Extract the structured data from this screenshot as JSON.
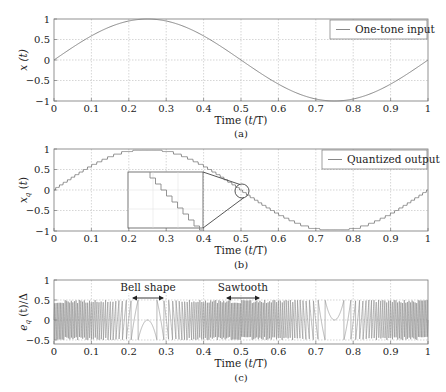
{
  "chart_data": [
    {
      "id": "a",
      "type": "line",
      "caption": "(a)",
      "xlabel": "Time (t/T)",
      "ylabel": "x (t)",
      "xlim": [
        0,
        1
      ],
      "ylim": [
        -1,
        1
      ],
      "xticks": [
        "0",
        "0.1",
        "0.2",
        "0.3",
        "0.4",
        "0.5",
        "0.6",
        "0.7",
        "0.8",
        "0.9",
        "1"
      ],
      "yticks": [
        "1",
        "0.5",
        "0",
        "-0.5",
        "-1"
      ],
      "grid": true,
      "legend": {
        "position": "upper right",
        "entries": [
          "One-tone input"
        ]
      },
      "series": [
        {
          "name": "One-tone input",
          "function": "sin(2*pi*t)",
          "x": [
            0,
            0.1,
            0.2,
            0.25,
            0.3,
            0.4,
            0.5,
            0.6,
            0.7,
            0.75,
            0.8,
            0.9,
            1
          ],
          "values": [
            0,
            0.59,
            0.95,
            1,
            0.95,
            0.59,
            0,
            -0.59,
            -0.95,
            -1,
            -0.95,
            -0.59,
            0
          ]
        }
      ]
    },
    {
      "id": "b",
      "type": "line",
      "caption": "(b)",
      "xlabel": "Time (t/T)",
      "ylabel": "x_q (t)",
      "xlim": [
        0,
        1
      ],
      "ylim": [
        -1,
        1
      ],
      "xticks": [
        "0",
        "0.1",
        "0.2",
        "0.3",
        "0.4",
        "0.5",
        "0.6",
        "0.7",
        "0.8",
        "0.9",
        "1"
      ],
      "yticks": [
        "1",
        "0.5",
        "0",
        "-0.5",
        "-1"
      ],
      "grid": true,
      "legend": {
        "position": "upper right",
        "entries": [
          "Quantized output"
        ]
      },
      "annotations": [
        "Inset zoom of staircase around t=0.5"
      ],
      "series": [
        {
          "name": "Quantized output",
          "function": "quantized sin(2*pi*t)",
          "x": [
            0,
            0.1,
            0.2,
            0.25,
            0.3,
            0.4,
            0.5,
            0.6,
            0.7,
            0.75,
            0.8,
            0.9,
            1
          ],
          "values": [
            0,
            0.59,
            0.95,
            0.97,
            0.95,
            0.59,
            0,
            -0.59,
            -0.95,
            -0.97,
            -0.95,
            -0.59,
            0
          ]
        }
      ]
    },
    {
      "id": "c",
      "type": "line",
      "caption": "(c)",
      "xlabel": "Time (t/T)",
      "ylabel": "e_q (t)/Δ",
      "xlim": [
        0,
        1
      ],
      "ylim": [
        -0.6,
        1
      ],
      "xticks": [
        "0",
        "0.1",
        "0.2",
        "0.3",
        "0.4",
        "0.5",
        "0.6",
        "0.7",
        "0.8",
        "0.9",
        "1"
      ],
      "yticks": [
        "1",
        "0.5",
        "0",
        "-0.5"
      ],
      "grid": true,
      "annotations": [
        "Bell shape",
        "Sawtooth"
      ],
      "series": [
        {
          "name": "Quantization error",
          "description": "Sawtooth oscillating between -0.5 and 0.5; bell-shaped around t=0.25 (min -0.5) and t=0.75 (max 0.5)"
        }
      ]
    }
  ],
  "labels": {
    "a_ylabel": "x (t)",
    "b_ylabel": "x",
    "b_ysub": "q",
    "c_ylabel_pre": "e",
    "c_ysub": "q",
    "c_ylabel_post": " (t)/Δ",
    "xlabel_pre": "Time (",
    "xlabel_t": "t",
    "xlabel_post": "/T)",
    "legend_a": "One-tone input",
    "legend_b": "Quantized output",
    "cap_a": "(a)",
    "cap_b": "(b)",
    "cap_c": "(c)",
    "bell": "Bell shape",
    "saw": "Sawtooth"
  }
}
